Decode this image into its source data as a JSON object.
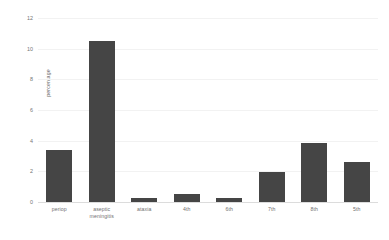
{
  "chart_data": {
    "type": "bar",
    "title": "",
    "xlabel": "",
    "ylabel": "percentage",
    "ylim": [
      0,
      12
    ],
    "yticks": [
      0,
      2,
      4,
      6,
      8,
      10,
      12
    ],
    "grid": true,
    "legend": null,
    "bar_color": "#454545",
    "background_color": "#ffffff",
    "categories": [
      "periop",
      "aseptic\nmeningitis",
      "ataxia",
      "4th",
      "6th",
      "7th",
      "8th",
      "5th"
    ],
    "values": [
      3.4,
      10.5,
      0.25,
      0.5,
      0.25,
      1.95,
      3.85,
      2.6
    ]
  }
}
